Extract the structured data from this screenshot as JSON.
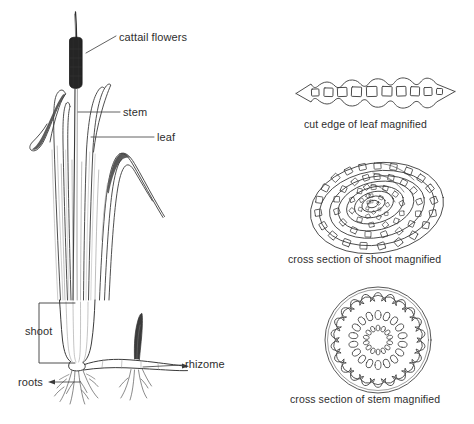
{
  "figure": {
    "background_color": "#ffffff",
    "ink_color": "#3a3a3a",
    "text_color": "#2e2e2e"
  },
  "plant_labels": {
    "cattail_flowers": "cattail flowers",
    "stem": "stem",
    "leaf": "leaf",
    "shoot": "shoot",
    "roots": "roots",
    "rhizome": "rhizome"
  },
  "detail_captions": {
    "leaf_section": "cut edge of leaf magnified",
    "shoot_section": "cross section of shoot magnified",
    "stem_section": "cross section of stem magnified"
  },
  "detail_structure": {
    "leaf_air_chambers": 10,
    "leaf_scallops_top": 5,
    "leaf_scallops_bottom": 5,
    "shoot_spiral_bands": 6,
    "stem_outer_bundles": 22,
    "stem_middle_bundles": 18,
    "stem_inner_bundles": 14
  }
}
